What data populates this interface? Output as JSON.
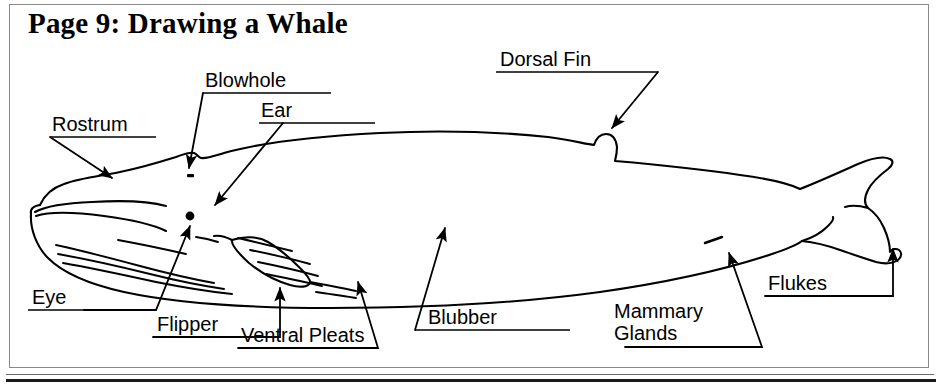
{
  "title": "Page 9: Drawing a Whale",
  "diagram": {
    "line_color": "#000000",
    "frame_color": "#8a8a8a",
    "background": "#ffffff"
  },
  "labels": {
    "rostrum": "Rostrum",
    "blowhole": "Blowhole",
    "ear": "Ear",
    "dorsal_fin": "Dorsal Fin",
    "eye": "Eye",
    "flipper": "Flipper",
    "ventral_pleats": "Ventral Pleats",
    "blubber": "Blubber",
    "mammary_glands_line1": "Mammary",
    "mammary_glands_line2": "Glands",
    "flukes": "Flukes"
  }
}
